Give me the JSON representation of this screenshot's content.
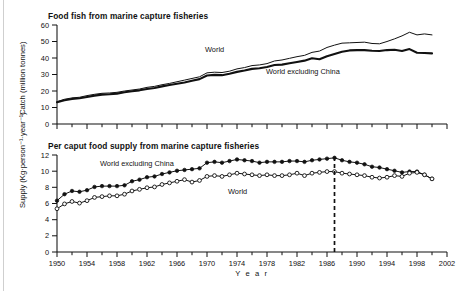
{
  "figure": {
    "background": "#ffffff",
    "ink_color": "#111111"
  },
  "panels": [
    {
      "id": "catch",
      "title": "Food fish from marine capture fisheries",
      "y_axis_title": "Catch (million tonnes)",
      "y_ticks": [
        "0",
        "10",
        "20",
        "30",
        "40",
        "50",
        "60"
      ],
      "series_labels": [
        {
          "text": "World",
          "x": 205,
          "y": 52
        },
        {
          "text": "World excluding China",
          "x": 266,
          "y": 74
        }
      ]
    },
    {
      "id": "supply",
      "title": "Per caput food supply from marine capture fisheries",
      "y_axis_title": "Supply (Kg·person⁻¹·year⁻¹)",
      "y_ticks": [
        "0",
        "2",
        "4",
        "6",
        "8",
        "10",
        "12"
      ],
      "series_labels": [
        {
          "text": "World excluding China",
          "x": 100,
          "y": 166
        },
        {
          "text": "World",
          "x": 228,
          "y": 194
        }
      ]
    }
  ],
  "x_axis": {
    "title": "Y e a r",
    "tick_labels": [
      "1950",
      "1954",
      "1958",
      "1962",
      "1966",
      "1970",
      "1974",
      "1978",
      "1982",
      "1986",
      "1990",
      "1994",
      "1998",
      "2002"
    ],
    "min": 1950,
    "max": 2002,
    "tick_step": 4,
    "minor_tick_step": 2
  },
  "chart_data": [
    {
      "type": "line",
      "title": "Food fish from marine capture fisheries",
      "xlabel": "Year",
      "ylabel": "Catch (million tonnes)",
      "xlim": [
        1950,
        2002
      ],
      "ylim": [
        0,
        60
      ],
      "grid": false,
      "legend": "inline labels on curves",
      "x": [
        1950,
        1951,
        1952,
        1953,
        1954,
        1955,
        1956,
        1957,
        1958,
        1959,
        1960,
        1961,
        1962,
        1963,
        1964,
        1965,
        1966,
        1967,
        1968,
        1969,
        1970,
        1971,
        1972,
        1973,
        1974,
        1975,
        1976,
        1977,
        1978,
        1979,
        1980,
        1981,
        1982,
        1983,
        1984,
        1985,
        1986,
        1987,
        1988,
        1989,
        1990,
        1991,
        1992,
        1993,
        1994,
        1995,
        1996,
        1997,
        1998,
        1999,
        2000
      ],
      "series": [
        {
          "name": "World",
          "style": "thin line",
          "values": [
            13.5,
            15.0,
            15.8,
            16.2,
            17.2,
            18.0,
            18.6,
            18.8,
            19.2,
            20.0,
            20.6,
            21.2,
            22.2,
            22.8,
            23.8,
            24.6,
            25.6,
            26.6,
            27.6,
            28.6,
            31.0,
            31.4,
            31.2,
            32.0,
            33.4,
            34.2,
            35.4,
            35.8,
            36.6,
            38.2,
            38.8,
            39.8,
            40.8,
            41.6,
            43.4,
            44.2,
            46.4,
            47.8,
            49.0,
            49.2,
            49.4,
            49.6,
            48.8,
            48.6,
            50.0,
            51.6,
            53.4,
            55.6,
            54.0,
            54.6,
            54.0
          ]
        },
        {
          "name": "World excluding China",
          "style": "thick line",
          "values": [
            13.2,
            14.4,
            15.2,
            15.6,
            16.4,
            17.2,
            17.8,
            18.0,
            18.4,
            19.2,
            19.8,
            20.4,
            21.2,
            21.8,
            22.8,
            23.6,
            24.4,
            25.2,
            26.2,
            27.2,
            29.4,
            29.8,
            29.6,
            30.4,
            31.6,
            32.4,
            33.4,
            33.8,
            34.6,
            35.8,
            36.0,
            36.8,
            37.6,
            38.4,
            39.8,
            39.2,
            41.0,
            42.4,
            43.8,
            44.6,
            44.8,
            44.8,
            44.4,
            44.2,
            44.8,
            45.0,
            44.2,
            45.4,
            43.2,
            43.0,
            42.8
          ]
        }
      ]
    },
    {
      "type": "line",
      "title": "Per caput food supply from marine capture fisheries",
      "xlabel": "Year",
      "ylabel": "Supply (Kg·person⁻¹·year⁻¹)",
      "xlim": [
        1950,
        2002
      ],
      "ylim": [
        0,
        12
      ],
      "grid": false,
      "legend": "inline labels on curves",
      "annotations": [
        {
          "type": "vertical-dashed-line",
          "x": 1987
        }
      ],
      "x": [
        1950,
        1951,
        1952,
        1953,
        1954,
        1955,
        1956,
        1957,
        1958,
        1959,
        1960,
        1961,
        1962,
        1963,
        1964,
        1965,
        1966,
        1967,
        1968,
        1969,
        1970,
        1971,
        1972,
        1973,
        1974,
        1975,
        1976,
        1977,
        1978,
        1979,
        1980,
        1981,
        1982,
        1983,
        1984,
        1985,
        1986,
        1987,
        1988,
        1989,
        1990,
        1991,
        1992,
        1993,
        1994,
        1995,
        1996,
        1997,
        1998,
        1999,
        2000
      ],
      "series": [
        {
          "name": "World excluding China",
          "marker": "filled-circle",
          "values": [
            6.35,
            7.15,
            7.55,
            7.45,
            7.65,
            8.05,
            8.15,
            8.15,
            8.15,
            8.25,
            8.75,
            8.95,
            9.25,
            9.35,
            9.65,
            9.85,
            10.05,
            10.15,
            10.25,
            10.35,
            11.05,
            11.15,
            11.05,
            11.25,
            11.45,
            11.35,
            11.25,
            11.05,
            11.15,
            11.15,
            11.15,
            11.25,
            11.25,
            11.15,
            11.35,
            11.45,
            11.55,
            11.65,
            11.35,
            11.15,
            11.05,
            10.85,
            10.55,
            10.45,
            10.25,
            10.05,
            9.85,
            9.95,
            9.95,
            9.55,
            9.05
          ],
          "marker_years_step": 1
        },
        {
          "name": "World",
          "marker": "open-circle",
          "values": [
            5.35,
            5.95,
            6.25,
            6.05,
            6.35,
            6.75,
            6.85,
            6.95,
            6.95,
            7.15,
            7.55,
            7.75,
            7.95,
            8.05,
            8.35,
            8.55,
            8.75,
            8.95,
            8.65,
            8.85,
            9.35,
            9.45,
            9.35,
            9.55,
            9.75,
            9.65,
            9.55,
            9.45,
            9.55,
            9.45,
            9.45,
            9.55,
            9.75,
            9.45,
            9.75,
            9.85,
            9.95,
            9.95,
            9.75,
            9.65,
            9.55,
            9.45,
            9.25,
            9.15,
            9.25,
            9.45,
            9.35,
            9.75,
            9.85,
            9.55,
            9.05
          ],
          "marker_years_step": 1
        }
      ]
    }
  ]
}
